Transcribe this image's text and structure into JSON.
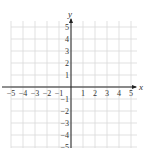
{
  "chart_data": {
    "type": "scatter",
    "title": "",
    "xlabel": "x",
    "ylabel": "y",
    "xlim": [
      -5,
      5
    ],
    "ylim": [
      -5,
      5
    ],
    "grid": true,
    "x_ticks": [
      "-5",
      "-4",
      "-3",
      "-2",
      "-1",
      "1",
      "2",
      "3",
      "4",
      "5"
    ],
    "y_ticks": [
      "5",
      "4",
      "3",
      "2",
      "1",
      "-1",
      "-2",
      "-3",
      "-4",
      "-5"
    ],
    "series": []
  },
  "axes": {
    "x_label": "x",
    "y_label": "y"
  },
  "colors": {
    "grid": "#d9d9d9",
    "axis": "#222222",
    "text": "#333333"
  }
}
